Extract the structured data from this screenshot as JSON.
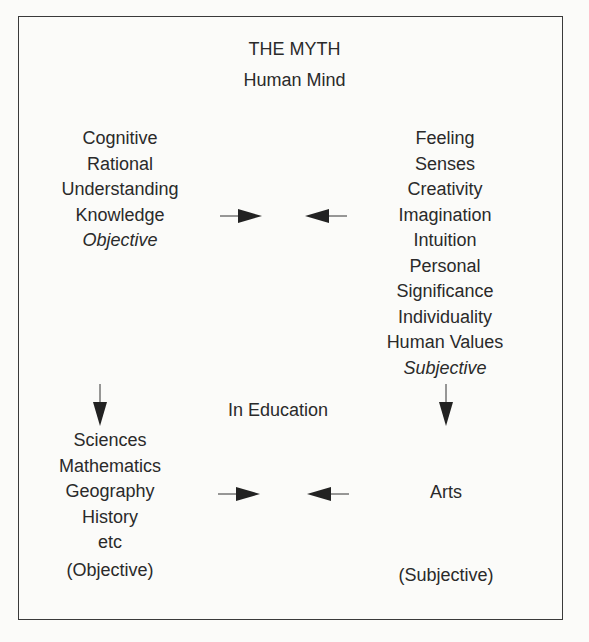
{
  "title": "THE MYTH",
  "subtitle": "Human Mind",
  "left_top": {
    "items": [
      "Cognitive",
      "Rational",
      "Understanding",
      "Knowledge"
    ],
    "label": "Objective"
  },
  "right_top": {
    "items": [
      "Feeling",
      "Senses",
      "Creativity",
      "Imagination",
      "Intuition",
      "Personal",
      "Significance",
      "Individuality",
      "Human Values"
    ],
    "label": "Subjective"
  },
  "middle_label": "In Education",
  "left_bottom": {
    "items": [
      "Sciences",
      "Mathematics",
      "Geography",
      "History",
      "etc"
    ],
    "label": "(Objective)"
  },
  "right_bottom": {
    "items": [
      "Arts"
    ],
    "label": "(Subjective)"
  },
  "colors": {
    "ink": "#2a2a2a",
    "border": "#3a3a3a",
    "background": "#fbfbf9"
  }
}
